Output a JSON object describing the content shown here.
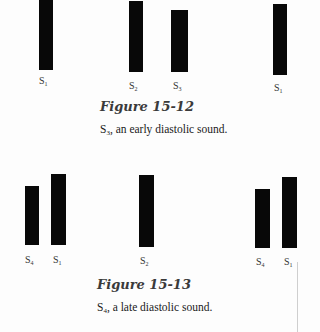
{
  "figures": [
    {
      "title": "Figure 15-12",
      "caption_sub": "3",
      "caption_rest": ", an early diastolic sound.",
      "bars": [
        {
          "label_sub": "1",
          "x": 39,
          "w": 14,
          "top": 0,
          "bottom": 70,
          "label_x": 39,
          "label_y": 75
        },
        {
          "label_sub": "2",
          "x": 129,
          "w": 14,
          "top": 1,
          "bottom": 72,
          "label_x": 129,
          "label_y": 80
        },
        {
          "label_sub": "3",
          "x": 171,
          "w": 17,
          "top": 10,
          "bottom": 72,
          "label_x": 173,
          "label_y": 80
        },
        {
          "label_sub": "1",
          "x": 273,
          "w": 14,
          "top": 4,
          "bottom": 75,
          "label_x": 274,
          "label_y": 82
        }
      ]
    },
    {
      "title": "Figure 15-13",
      "caption_sub": "4",
      "caption_rest": ", a late diastolic sound.",
      "bars": [
        {
          "label_sub": "4",
          "x": 25,
          "w": 14,
          "top": 186,
          "bottom": 245,
          "label_x": 25,
          "label_y": 254
        },
        {
          "label_sub": "1",
          "x": 51,
          "w": 15,
          "top": 174,
          "bottom": 245,
          "label_x": 53,
          "label_y": 254
        },
        {
          "label_sub": "2",
          "x": 139,
          "w": 15,
          "top": 175,
          "bottom": 247,
          "label_x": 140,
          "label_y": 255
        },
        {
          "label_sub": "4",
          "x": 255,
          "w": 15,
          "top": 189,
          "bottom": 248,
          "label_x": 256,
          "label_y": 256
        },
        {
          "label_sub": "1",
          "x": 282,
          "w": 15,
          "top": 177,
          "bottom": 248,
          "label_x": 284,
          "label_y": 256
        }
      ]
    }
  ],
  "sound_letter": "S"
}
